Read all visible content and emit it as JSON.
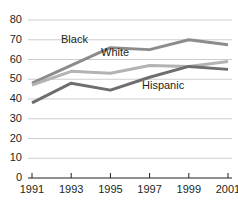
{
  "chart_data": {
    "type": "line",
    "title": "",
    "subtitle": "",
    "xlabel": "",
    "ylabel": "",
    "x": [
      "1991",
      "1993",
      "1995",
      "1997",
      "1999",
      "2001"
    ],
    "categories": [
      "1991",
      "1993",
      "1995",
      "1997",
      "1999",
      "2001"
    ],
    "series": [
      {
        "name": "Black",
        "color": "#8c8c8c",
        "values": [
          48,
          57,
          66,
          65,
          70,
          67.5
        ]
      },
      {
        "name": "White",
        "color": "#b3b3b3",
        "values": [
          47,
          54,
          53,
          57,
          56.5,
          59
        ]
      },
      {
        "name": "Hispanic",
        "color": "#6e6e6e",
        "values": [
          38,
          48,
          44.5,
          51,
          56.5,
          55
        ]
      }
    ],
    "ylim": [
      0,
      80
    ],
    "yticks": [
      0,
      10,
      20,
      30,
      40,
      50,
      60,
      70,
      80
    ],
    "ytick_labels": [
      "0",
      "10",
      "20",
      "30",
      "40",
      "50",
      "60",
      "70",
      "80"
    ],
    "xtick_labels": [
      "1991",
      "1993",
      "1995",
      "1997",
      "1999",
      "2001"
    ],
    "grid": true,
    "grid_axis": "y",
    "grid_color": "#b9b9b9",
    "legend": "inline-annotations",
    "annotations": [
      {
        "text": "Black",
        "x": "1993",
        "y": 62
      },
      {
        "text": "White",
        "x": "1995",
        "y": 58
      },
      {
        "text": "Hispanic",
        "x": "1998",
        "y": 47
      }
    ],
    "axis_color": "#231f20",
    "background": "#ffffff"
  },
  "axis": {
    "y_labels": [
      "80",
      "70",
      "60",
      "50",
      "40",
      "30",
      "20",
      "10",
      "0"
    ],
    "x_labels": [
      "1991",
      "1993",
      "1995",
      "1997",
      "1999",
      "2001"
    ]
  },
  "labels": {
    "black": "Black",
    "white": "White",
    "hispanic": "Hispanic"
  }
}
